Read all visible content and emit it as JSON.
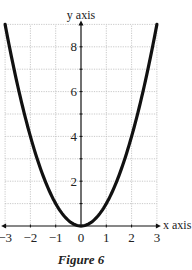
{
  "chart_data": {
    "type": "line",
    "title": "",
    "caption": "Figure 6",
    "function": "y = x^2",
    "xlabel": "x axis",
    "ylabel": "y axis",
    "xlim": [
      -3,
      3
    ],
    "ylim": [
      0,
      9
    ],
    "xticks": [
      -3,
      -2,
      -1,
      0,
      1,
      2,
      3
    ],
    "xtick_labels": [
      "−3",
      "−2",
      "−1",
      "0",
      "1",
      "2",
      "3"
    ],
    "yticks": [
      2,
      4,
      6,
      8
    ],
    "ytick_labels": [
      "2",
      "4",
      "6",
      "8"
    ],
    "grid": true,
    "grid_style": "dotted, every 1 unit",
    "series": [
      {
        "name": "y = x^2",
        "x": [
          -3,
          -2.5,
          -2,
          -1.5,
          -1,
          -0.5,
          0,
          0.5,
          1,
          1.5,
          2,
          2.5,
          3
        ],
        "y": [
          9,
          6.25,
          4,
          2.25,
          1,
          0.25,
          0,
          0.25,
          1,
          2.25,
          4,
          6.25,
          9
        ]
      }
    ],
    "legend": null
  },
  "figure": {
    "caption": "Figure 6",
    "x_axis_label": "x axis",
    "y_axis_label": "y axis"
  }
}
